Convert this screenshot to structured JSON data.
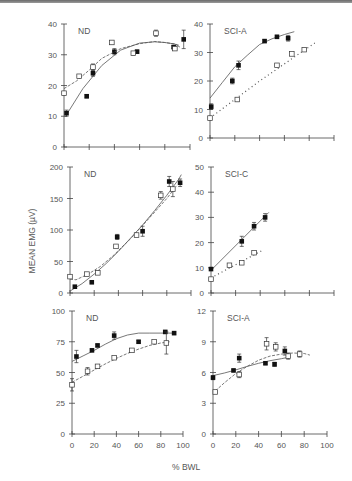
{
  "figure": {
    "y_axis_label": "MEAN EMG (µV)",
    "x_axis_label": "% BWL"
  },
  "chart_data": [
    {
      "type": "scatter",
      "panel": "top-left",
      "title": "ND",
      "xlabel": "% BWL",
      "ylabel": "MEAN EMG (µV)",
      "xlim": [
        0,
        100
      ],
      "ylim": [
        0,
        40
      ],
      "xticks": [
        0,
        20,
        40,
        60,
        80,
        100
      ],
      "yticks": [
        0,
        10,
        20,
        30,
        40
      ],
      "box": [
        64,
        24,
        190,
        147
      ],
      "series": [
        {
          "name": "filled",
          "marker": "filled-square",
          "line": "solid",
          "x": [
            2,
            18,
            23,
            40,
            58,
            87,
            95
          ],
          "y": [
            11,
            16.5,
            24,
            31,
            31,
            32.5,
            35
          ],
          "err": [
            1,
            0.5,
            1,
            1,
            0.5,
            0.5,
            3
          ],
          "fit_x": [
            2,
            15,
            30,
            45,
            60,
            72,
            80,
            88,
            92
          ],
          "fit_y": [
            10.5,
            19,
            26.5,
            31.5,
            33.8,
            34.2,
            34,
            33.5,
            32.5
          ]
        },
        {
          "name": "open",
          "marker": "open-square",
          "line": "dashed",
          "x": [
            0,
            12,
            23,
            38,
            55,
            73,
            88
          ],
          "y": [
            17.5,
            23,
            26,
            34,
            30.5,
            37,
            32
          ],
          "err": [
            0.5,
            0.5,
            1,
            0.5,
            0.5,
            1,
            0.5
          ],
          "fit_x": [
            0,
            10,
            20,
            30,
            45,
            60,
            72,
            80,
            88,
            92
          ],
          "fit_y": [
            19,
            21.5,
            25,
            28.8,
            32,
            33.6,
            34.3,
            34,
            33.5,
            33
          ]
        }
      ]
    },
    {
      "type": "scatter",
      "panel": "top-right",
      "title": "SCI-A",
      "xlabel": "% BWL",
      "ylabel": "MEAN EMG (µV)",
      "xlim": [
        0,
        100
      ],
      "ylim": [
        0,
        40
      ],
      "xticks": [
        0,
        20,
        40,
        60,
        80,
        100
      ],
      "yticks": [
        0,
        10,
        20,
        30,
        40
      ],
      "box": [
        210,
        24,
        334,
        138
      ],
      "series": [
        {
          "name": "filled",
          "marker": "filled-square",
          "line": "solid",
          "x": [
            1,
            18,
            23,
            44,
            54,
            63
          ],
          "y": [
            11,
            20,
            25.5,
            34,
            35.5,
            35
          ],
          "err": [
            1,
            1,
            1.5,
            0.5,
            0.5,
            1
          ],
          "fit_x": [
            0,
            10,
            20,
            30,
            40,
            50,
            60,
            68
          ],
          "fit_y": [
            14,
            19.5,
            25,
            29,
            32.8,
            34.8,
            36.3,
            37.3
          ]
        },
        {
          "name": "open",
          "marker": "open-square",
          "line": "dotted",
          "x": [
            0,
            22,
            54,
            66,
            76
          ],
          "y": [
            7,
            13.5,
            25.5,
            29.5,
            31
          ],
          "err": [
            0.5,
            0.5,
            0.5,
            0.5,
            0.5
          ],
          "fit_x": [
            0,
            20,
            40,
            60,
            80,
            85
          ],
          "fit_y": [
            7,
            13.5,
            20,
            26,
            32,
            33.5
          ]
        }
      ]
    },
    {
      "type": "scatter",
      "panel": "middle-left",
      "title": "ND",
      "xlabel": "% BWL",
      "ylabel": "MEAN EMG (µV)",
      "xlim": [
        0,
        100
      ],
      "ylim": [
        0,
        200
      ],
      "xticks": [
        0,
        20,
        40,
        60,
        80,
        100
      ],
      "yticks": [
        0,
        50,
        100,
        150,
        200
      ],
      "box": [
        70,
        167,
        191,
        293
      ],
      "series": [
        {
          "name": "filled",
          "marker": "filled-square",
          "line": "solid",
          "x": [
            4,
            18,
            39,
            60,
            82,
            91
          ],
          "y": [
            10,
            17,
            89,
            98,
            177,
            175
          ],
          "err": [
            1,
            1,
            4,
            8,
            8,
            6
          ],
          "fit_x": [
            0,
            10,
            20,
            30,
            40,
            50,
            60,
            70,
            80,
            90,
            92
          ],
          "fit_y": [
            3,
            15,
            30,
            47,
            66,
            87,
            108,
            131,
            155,
            181,
            188
          ]
        },
        {
          "name": "open",
          "marker": "open-square",
          "line": "dashed",
          "x": [
            0,
            14,
            23,
            38,
            55,
            75,
            85
          ],
          "y": [
            26,
            30,
            32,
            74,
            92,
            155,
            165
          ],
          "err": [
            1,
            1,
            1,
            1,
            1,
            6,
            12
          ],
          "fit_x": [
            0,
            5,
            15,
            25,
            35,
            50,
            65,
            80,
            88
          ],
          "fit_y": [
            22,
            21,
            30,
            42,
            58,
            86,
            118,
            150,
            170
          ]
        }
      ]
    },
    {
      "type": "scatter",
      "panel": "middle-right",
      "title": "SCI-C",
      "xlabel": "% BWL",
      "ylabel": "MEAN EMG (µV)",
      "xlim": [
        0,
        100
      ],
      "ylim": [
        0,
        50
      ],
      "xticks": [
        0,
        20,
        40,
        60,
        80,
        100
      ],
      "yticks": [
        0,
        10,
        20,
        30,
        40,
        50
      ],
      "box": [
        211,
        167,
        334,
        293
      ],
      "series": [
        {
          "name": "filled",
          "marker": "filled-square",
          "line": "solid",
          "x": [
            0,
            25,
            35,
            44
          ],
          "y": [
            9.5,
            20.5,
            26.5,
            30
          ],
          "err": [
            0.5,
            2,
            1.5,
            1.5
          ],
          "fit_x": [
            0,
            47
          ],
          "fit_y": [
            9,
            32
          ]
        },
        {
          "name": "open",
          "marker": "open-square",
          "line": "dotted",
          "x": [
            0,
            15,
            25,
            35
          ],
          "y": [
            5.5,
            11,
            12,
            16
          ],
          "err": [
            0.5,
            0.5,
            0.5,
            0.5
          ],
          "fit_x": [
            0,
            42
          ],
          "fit_y": [
            6,
            17
          ]
        }
      ]
    },
    {
      "type": "scatter",
      "panel": "bottom-left",
      "title": "ND",
      "xlabel": "% BWL",
      "ylabel": "MEAN EMG (µV)",
      "xlim": [
        0,
        100
      ],
      "ylim": [
        0,
        100
      ],
      "xticks": [
        0,
        20,
        40,
        60,
        80,
        100
      ],
      "yticks": [
        0,
        25,
        50,
        75,
        100
      ],
      "box": [
        72,
        311,
        183,
        434
      ],
      "series": [
        {
          "name": "filled",
          "marker": "filled-square",
          "line": "solid",
          "x": [
            4,
            18,
            23,
            38,
            60,
            84,
            92
          ],
          "y": [
            63,
            68,
            72,
            80,
            75,
            83,
            82
          ],
          "err": [
            5,
            1,
            1,
            3,
            1,
            1,
            1
          ],
          "fit_x": [
            0,
            10,
            20,
            30,
            40,
            50,
            60,
            70,
            80,
            92
          ],
          "fit_y": [
            59,
            63.5,
            68,
            73,
            77.5,
            80.5,
            82,
            82,
            82,
            82
          ]
        },
        {
          "name": "open",
          "marker": "open-square",
          "line": "dashed",
          "x": [
            0,
            14,
            23,
            38,
            54,
            74,
            85
          ],
          "y": [
            40,
            51,
            55,
            62,
            68,
            75,
            74
          ],
          "err": [
            5,
            3,
            1,
            1,
            1,
            1,
            9
          ],
          "fit_x": [
            0,
            10,
            20,
            30,
            40,
            50,
            60,
            70,
            80,
            88
          ],
          "fit_y": [
            42,
            47,
            52,
            57,
            61.5,
            65.5,
            69,
            72,
            74,
            75
          ]
        }
      ]
    },
    {
      "type": "scatter",
      "panel": "bottom-right",
      "title": "SCI-A",
      "xlabel": "% BWL",
      "ylabel": "MEAN EMG (µV)",
      "xlim": [
        0,
        100
      ],
      "ylim": [
        0,
        12
      ],
      "xticks": [
        0,
        20,
        40,
        60,
        80,
        100
      ],
      "yticks": [
        0,
        3,
        6,
        9,
        12
      ],
      "box": [
        213,
        311,
        327,
        434
      ],
      "series": [
        {
          "name": "filled",
          "marker": "filled-square",
          "line": "solid",
          "x": [
            0,
            18,
            23,
            46,
            54,
            63
          ],
          "y": [
            5.5,
            6.2,
            7.4,
            6.9,
            6.8,
            8.1
          ],
          "err": [
            0.2,
            0.1,
            0.4,
            0.1,
            0.2,
            0.4
          ],
          "fit_x": [
            0,
            10,
            20,
            30,
            40,
            50,
            60,
            67
          ],
          "fit_y": [
            5.7,
            5.95,
            6.25,
            6.6,
            6.9,
            7.15,
            7.35,
            7.5
          ]
        },
        {
          "name": "open",
          "marker": "open-square",
          "line": "dashed",
          "x": [
            2,
            23,
            47,
            55,
            66,
            76
          ],
          "y": [
            4.1,
            5.8,
            8.8,
            8.5,
            7.6,
            7.8
          ],
          "err": [
            0.1,
            0.3,
            0.6,
            0.4,
            0.3,
            0.3
          ],
          "fit_x": [
            2,
            10,
            20,
            30,
            40,
            50,
            60,
            70,
            80,
            85
          ],
          "fit_y": [
            4.2,
            5.0,
            5.9,
            6.6,
            7.2,
            7.6,
            7.8,
            7.9,
            7.85,
            7.7
          ]
        }
      ]
    }
  ]
}
